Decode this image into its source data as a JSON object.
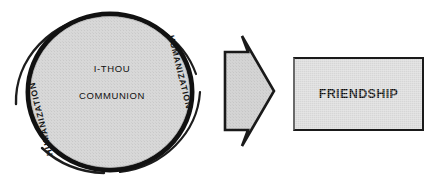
{
  "diagram": {
    "circle": {
      "center_line_1": "I-THOU",
      "center_line_2": "COMMUNION",
      "ring_label_right": "HUMANIZATION",
      "ring_label_left": "HUMANIZATION",
      "fill_color": "#d6d6d6",
      "ring_color": "#111111",
      "outer_arc_color": "#1a1a1a"
    },
    "arrow": {
      "direction": "right",
      "fill_color": "#d2d2d2",
      "outline_color": "#1a1a1a"
    },
    "result_box": {
      "label": "FRIENDSHIP",
      "fill_color": "#d6d6d6",
      "border_color": "#1a1a1a"
    }
  }
}
